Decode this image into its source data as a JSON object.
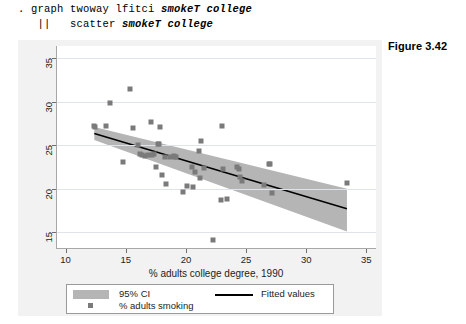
{
  "command": {
    "line1_prefix": ". graph twoway lfitci ",
    "line1_vars": "smokeT college",
    "line2_prefix": "   ||   scatter ",
    "line2_vars": "smokeT college"
  },
  "figure": {
    "caption": "Figure 3.42"
  },
  "chart_data": {
    "type": "scatter",
    "title": "",
    "xlabel": "% adults college degree, 1990",
    "ylabel": "",
    "xlim": [
      9.2,
      35.8
    ],
    "ylim": [
      13.2,
      36.4
    ],
    "xticks": [
      10,
      15,
      20,
      25,
      30,
      35
    ],
    "yticks": [
      15,
      20,
      25,
      30,
      35
    ],
    "grid": true,
    "legend_position": "below",
    "legend": [
      {
        "key": "ci",
        "label": "95% CI",
        "marker": "band",
        "color": "#b5b5b5"
      },
      {
        "key": "fit",
        "label": "Fitted values",
        "marker": "line",
        "color": "#000000"
      },
      {
        "key": "points",
        "label": "% adults smoking",
        "marker": "square",
        "color": "#7a7a7a"
      }
    ],
    "series": [
      {
        "name": "% adults smoking",
        "marker": "square",
        "color": "#7a7a7a",
        "points": [
          [
            12.3,
            27.2
          ],
          [
            12.4,
            27.1
          ],
          [
            13.3,
            27.2
          ],
          [
            13.6,
            29.8
          ],
          [
            14.7,
            23.1
          ],
          [
            15.3,
            31.5
          ],
          [
            15.5,
            27.0
          ],
          [
            15.9,
            25.0
          ],
          [
            16.1,
            24.0
          ],
          [
            16.3,
            23.9
          ],
          [
            16.5,
            23.8
          ],
          [
            16.8,
            23.9
          ],
          [
            17.0,
            27.7
          ],
          [
            17.1,
            23.9
          ],
          [
            17.3,
            24.0
          ],
          [
            17.4,
            22.5
          ],
          [
            17.6,
            25.2
          ],
          [
            17.7,
            25.1
          ],
          [
            17.8,
            27.1
          ],
          [
            17.9,
            21.6
          ],
          [
            18.2,
            23.6
          ],
          [
            18.3,
            20.6
          ],
          [
            18.6,
            23.6
          ],
          [
            18.9,
            23.8
          ],
          [
            19.0,
            23.7
          ],
          [
            19.1,
            23.6
          ],
          [
            19.7,
            19.6
          ],
          [
            20.0,
            20.3
          ],
          [
            20.4,
            22.5
          ],
          [
            20.5,
            20.2
          ],
          [
            20.7,
            21.9
          ],
          [
            21.0,
            24.3
          ],
          [
            21.1,
            21.2
          ],
          [
            21.2,
            25.5
          ],
          [
            21.4,
            22.4
          ],
          [
            22.2,
            14.1
          ],
          [
            22.8,
            18.7
          ],
          [
            22.9,
            27.2
          ],
          [
            23.0,
            22.3
          ],
          [
            23.3,
            18.8
          ],
          [
            24.2,
            22.5
          ],
          [
            24.3,
            22.3
          ],
          [
            24.4,
            21.3
          ],
          [
            24.6,
            20.9
          ],
          [
            26.4,
            20.4
          ],
          [
            26.8,
            22.9
          ],
          [
            26.9,
            22.8
          ],
          [
            27.1,
            19.5
          ],
          [
            33.3,
            20.7
          ]
        ]
      }
    ],
    "fit_line": {
      "name": "Fitted values",
      "color": "#000000",
      "x": [
        12.3,
        33.3
      ],
      "y": [
        26.35,
        17.7
      ]
    },
    "ci_band": {
      "name": "95% CI",
      "color": "#b5b5b5",
      "x": [
        12.3,
        33.3
      ],
      "upper": [
        27.1,
        20.0
      ],
      "lower": [
        25.6,
        15.1
      ]
    }
  }
}
